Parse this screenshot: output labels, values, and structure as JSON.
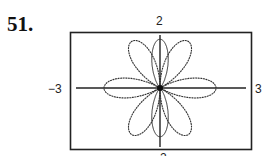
{
  "problem_number": "51.",
  "chart_data": {
    "type": "line",
    "title": "",
    "xlim": [
      -3,
      3
    ],
    "ylim": [
      -2,
      2
    ],
    "tick_labels": {
      "left": "−3",
      "right": "3",
      "top": "2",
      "bottom": "−2"
    },
    "grid": false,
    "series": [
      {
        "name": "curve",
        "petals": 6,
        "petal_radius": 2
      }
    ]
  },
  "labels": {
    "x_min": "−3",
    "x_max": "3",
    "y_max": "2",
    "y_min": "−2"
  }
}
